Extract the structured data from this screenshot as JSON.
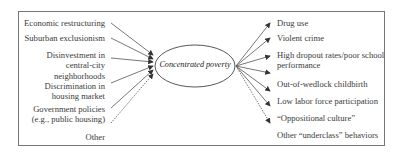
{
  "diagram": {
    "center": {
      "label": "Concentrated poverty"
    },
    "causes": [
      {
        "label": "Economic restructuring"
      },
      {
        "label": "Suburban exclusionism"
      },
      {
        "label": "Disinvestment in\ncentral-city\nneighborhoods"
      },
      {
        "label": "Discrimination in\nhousing market"
      },
      {
        "label": "Government policies\n(e.g., public housing)"
      },
      {
        "label": "Other"
      }
    ],
    "effects": [
      {
        "label": "Drug use"
      },
      {
        "label": "Violent crime"
      },
      {
        "label": "High dropout rates/poor school\nperformance"
      },
      {
        "label": "Out-of-wedlock childbirth"
      },
      {
        "label": "Low labor force participation"
      },
      {
        "label": "“Oppositional culture”"
      },
      {
        "label": "Other “underclass” behaviors"
      }
    ],
    "colors": {
      "line": "#444444",
      "border": "#777777",
      "text": "#3a3a3a"
    }
  }
}
